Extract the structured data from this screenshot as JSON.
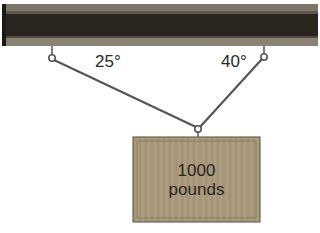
{
  "diagram": {
    "beam": {
      "color_body": "#2b2520",
      "color_rail": "#8a8275"
    },
    "angles": {
      "left": "25°",
      "right": "40°"
    },
    "weight": {
      "value": "1000",
      "unit": "pounds",
      "color": "#a7977a"
    },
    "cable_color": "#555555"
  }
}
